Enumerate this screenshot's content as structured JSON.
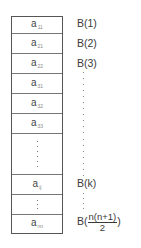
{
  "diagram": {
    "title": "",
    "storage_cells": [
      {
        "base": "a",
        "sub": "11"
      },
      {
        "base": "a",
        "sub": "21"
      },
      {
        "base": "a",
        "sub": "22"
      },
      {
        "base": "a",
        "sub": "31"
      },
      {
        "base": "a",
        "sub": "32"
      },
      {
        "base": "a",
        "sub": "33"
      },
      {
        "base": "",
        "sub": "",
        "ellipsis": "vertical"
      },
      {
        "base": "a",
        "sub": "ij"
      },
      {
        "base": "",
        "sub": "",
        "ellipsis": "vertical"
      },
      {
        "base": "a",
        "sub": "nn"
      }
    ],
    "index_labels": [
      {
        "text": "B(1)"
      },
      {
        "text": "B(2)"
      },
      {
        "text": "B(3)"
      },
      {
        "text": "B(k)"
      },
      {
        "prefix": "B(",
        "numerator": "n(n+1)",
        "denominator": "2",
        "suffix": ")"
      }
    ],
    "colors": {
      "border": "#555555",
      "text": "#3a3a3a",
      "subscript": "#888888",
      "background": "#ffffff"
    }
  }
}
